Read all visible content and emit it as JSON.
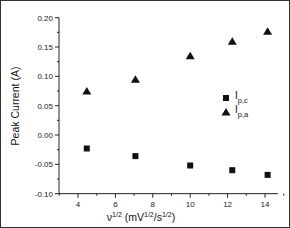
{
  "chart_data": {
    "type": "scatter",
    "title": "",
    "xlabel": "ν^1/2 (mV^1/2/s^1/2)",
    "ylabel": "Peak Current (A)",
    "xlim": [
      3.0,
      15.0
    ],
    "ylim": [
      -0.1,
      0.2
    ],
    "xticks": [
      4,
      6,
      8,
      10,
      12,
      14
    ],
    "yticks": [
      -0.1,
      -0.05,
      0.0,
      0.05,
      0.1,
      0.15,
      0.2
    ],
    "grid": false,
    "legend_position": "center-right",
    "series": [
      {
        "name": "Ip,c",
        "marker": "square",
        "x": [
          4.47,
          7.07,
          10.0,
          12.25,
          14.14
        ],
        "y": [
          -0.023,
          -0.036,
          -0.052,
          -0.06,
          -0.068
        ]
      },
      {
        "name": "Ip,a",
        "marker": "triangle",
        "x": [
          4.47,
          7.07,
          10.0,
          12.25,
          14.14
        ],
        "y": [
          0.075,
          0.095,
          0.135,
          0.16,
          0.177
        ]
      }
    ]
  },
  "labels": {
    "ylabel": "Peak Current (A)",
    "xlabel_main": "ν",
    "xlabel_sup1": "1/2",
    "xlabel_paren_open": " (mV",
    "xlabel_sup2": "1/2",
    "xlabel_slash": "/s",
    "xlabel_sup3": "1/2",
    "xlabel_paren_close": ")",
    "legend": [
      {
        "main": "I",
        "sub": "p,c"
      },
      {
        "main": "I",
        "sub": "p,a"
      }
    ],
    "ytick_labels": [
      "-0.10",
      "-0.05",
      "0.00",
      "0.05",
      "0.10",
      "0.15",
      "0.20"
    ],
    "xtick_labels": [
      "4",
      "6",
      "8",
      "10",
      "12",
      "14"
    ]
  }
}
